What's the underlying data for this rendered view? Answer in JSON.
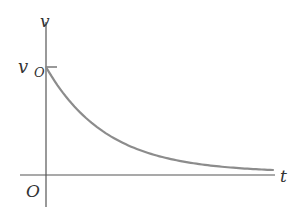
{
  "diagram": {
    "labels": {
      "y_axis": "v",
      "x_axis": "t",
      "origin": "O",
      "initial_value_main": "v",
      "initial_value_sub": "O"
    },
    "colors": {
      "axis": "#555555",
      "curve": "#8c8c8c",
      "text": "#333333",
      "background": "#ffffff"
    }
  },
  "chart_data": {
    "type": "line",
    "title": "",
    "xlabel": "t",
    "ylabel": "v",
    "y_tick_labels": [
      "v_O"
    ],
    "origin_label": "O",
    "function": "v(t) = v_O * exp(-t / tau)",
    "grid": false,
    "legend": null,
    "series": [
      {
        "name": "v(t)",
        "x": [
          0,
          0.5,
          1,
          1.5,
          2,
          2.5,
          3,
          3.5,
          3.75
        ],
        "values": [
          1.0,
          0.61,
          0.37,
          0.22,
          0.14,
          0.08,
          0.05,
          0.03,
          0.02
        ]
      }
    ],
    "xlim": [
      0,
      3.75
    ],
    "ylim": [
      0,
      1.0
    ]
  }
}
